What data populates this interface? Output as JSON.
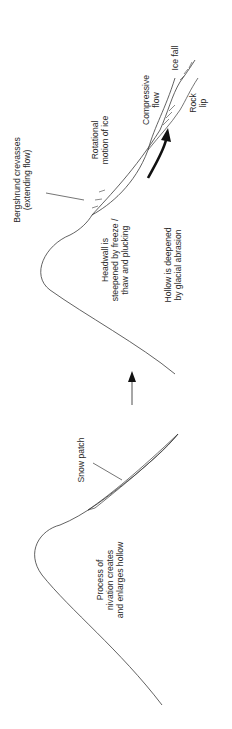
{
  "diagram": {
    "orientation": "rotated -90deg (reads bottom-to-top)",
    "stages": [
      {
        "name": "nivation-stage",
        "labels": {
          "snow_patch": "Snow patch",
          "process": [
            "Process of",
            "nivation creates",
            "and enlarges hollow"
          ]
        }
      },
      {
        "name": "cirque-glacier-stage",
        "labels": {
          "bergshrund": [
            "Bergshrund crevasses",
            "(extending flow)"
          ],
          "rotational": [
            "Rotational",
            "motion of ice"
          ],
          "compressive": [
            "Compressive",
            "flow"
          ],
          "ice_fall": "Ice fall",
          "rock_lip": [
            "Rock",
            "lip"
          ],
          "headwall": [
            "Headwall is",
            "steepened by freeze /",
            "thaw and plucking"
          ],
          "hollow": [
            "Hollow is deepened",
            "by glacial abrasion"
          ]
        }
      }
    ],
    "colors": {
      "line": "#3a3a3a",
      "arrow": "#111111",
      "text": "#2a2a2a"
    }
  }
}
